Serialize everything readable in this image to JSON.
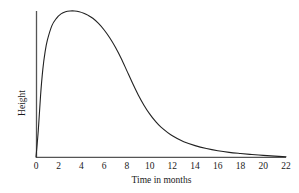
{
  "chart_data": {
    "type": "line",
    "title": "",
    "subtitle": "",
    "xlabel": "Time in months",
    "ylabel": "Height",
    "xlim": [
      0,
      22
    ],
    "ylim": [
      0,
      1
    ],
    "grid": false,
    "legend": false,
    "legend_position": "none",
    "xticks": [
      0,
      2,
      4,
      6,
      8,
      10,
      12,
      14,
      16,
      18,
      20,
      22
    ],
    "xtick_labels": [
      "0",
      "2",
      "4",
      "6",
      "8",
      "10",
      "12",
      "14",
      "16",
      "18",
      "20",
      "22"
    ],
    "yticks": [],
    "ytick_labels": [],
    "annotations": [],
    "series": [
      {
        "name": "Height",
        "x": [
          0,
          0.2,
          0.4,
          0.6,
          0.8,
          1,
          1.4,
          1.8,
          2.2,
          2.6,
          3,
          3.4,
          3.8,
          4.2,
          4.6,
          5,
          5.5,
          6,
          6.5,
          7,
          7.5,
          8,
          8.5,
          9,
          9.5,
          10,
          10.5,
          11,
          12,
          13,
          14,
          15,
          16,
          17,
          18,
          19,
          20,
          21,
          22
        ],
        "y": [
          0,
          0.18,
          0.42,
          0.6,
          0.72,
          0.8,
          0.9,
          0.95,
          0.98,
          0.995,
          1,
          1,
          0.995,
          0.985,
          0.97,
          0.95,
          0.915,
          0.87,
          0.815,
          0.75,
          0.675,
          0.59,
          0.505,
          0.425,
          0.355,
          0.295,
          0.245,
          0.205,
          0.145,
          0.105,
          0.078,
          0.058,
          0.043,
          0.032,
          0.024,
          0.017,
          0.011,
          0.006,
          0.002
        ]
      }
    ],
    "curve_features": {
      "peak_x_months": 3.5,
      "peak_label": "maximum height near 3.5 months",
      "steepest_decline_x_months": 8.5,
      "tail_approaches_zero_x_months": 22,
      "shape": "rapid rise, broad rounded peak, long right-skewed decay"
    },
    "style": {
      "line_color": "#222222",
      "line_width": 1.1,
      "axis_color": "#555555",
      "axis_width": 1.2,
      "background": "#ffffff",
      "text_color": "#1a1a1a"
    },
    "geometry": {
      "origin_x_px": 36,
      "origin_y_px": 157,
      "x_axis_end_px": 286,
      "y_axis_top_px": 11,
      "px_per_month": 11.36,
      "plot_height_px": 143
    }
  }
}
